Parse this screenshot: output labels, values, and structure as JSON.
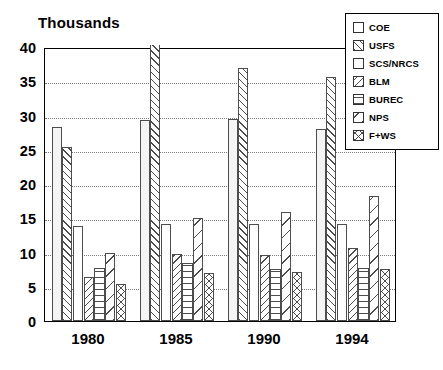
{
  "chart_data": {
    "type": "bar",
    "title": "Thousands",
    "xlabel": "",
    "ylabel": "",
    "ylim": [
      0,
      40
    ],
    "ytick_step": 5,
    "yticks": [
      "0",
      "5",
      "10",
      "15",
      "20",
      "25",
      "30",
      "35",
      "40"
    ],
    "grid": true,
    "grid_axis": "y",
    "legend_position": "top-right",
    "categories": [
      "1980",
      "1985",
      "1990",
      "1994"
    ],
    "series": [
      {
        "name": "COE",
        "pattern": "dotted",
        "values": [
          28.3,
          29.4,
          29.5,
          28.0
        ]
      },
      {
        "name": "USFS",
        "pattern": "forward-diagonal",
        "values": [
          25.4,
          40.0,
          36.9,
          35.6
        ],
        "clipped": [
          false,
          true,
          false,
          false
        ]
      },
      {
        "name": "SCS/NRCS",
        "pattern": "blank",
        "values": [
          13.9,
          14.2,
          14.1,
          14.2
        ]
      },
      {
        "name": "BLM",
        "pattern": "back-diagonal",
        "values": [
          6.4,
          9.8,
          9.7,
          10.6
        ]
      },
      {
        "name": "BUREC",
        "pattern": "horizontal-lines",
        "values": [
          7.7,
          8.4,
          7.6,
          7.7
        ]
      },
      {
        "name": "NPS",
        "pattern": "wide-back-diagonal",
        "values": [
          9.9,
          15.0,
          15.9,
          18.3
        ]
      },
      {
        "name": "F+WS",
        "pattern": "cross-hatch",
        "values": [
          5.4,
          7.0,
          7.1,
          7.6
        ]
      }
    ]
  },
  "legend": {
    "items": [
      {
        "label": "COE",
        "swatch": "dots-swatch"
      },
      {
        "label": "USFS",
        "swatch": "forward-diagonal-swatch"
      },
      {
        "label": "SCS/NRCS",
        "swatch": "blank-swatch"
      },
      {
        "label": "BLM",
        "swatch": "back-diagonal-swatch"
      },
      {
        "label": "BUREC",
        "swatch": "horizontal-lines-swatch"
      },
      {
        "label": "NPS",
        "swatch": "wide-back-diagonal-swatch"
      },
      {
        "label": "F+WS",
        "swatch": "cross-hatch-swatch"
      }
    ]
  },
  "colors": {
    "axis": "#000000",
    "gridline": "#7a7a7a",
    "bar_outline": "#4d4d4d",
    "background": "#ffffff"
  }
}
